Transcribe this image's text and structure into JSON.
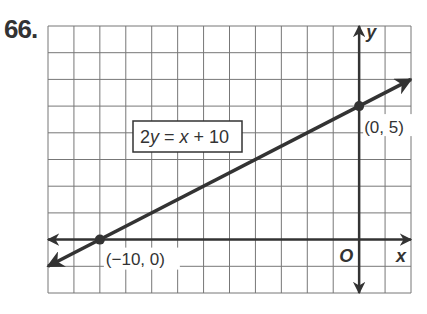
{
  "problem_number": "66.",
  "chart_data": {
    "type": "line",
    "title": "",
    "equation_label": "2y = x + 10",
    "xlabel": "x",
    "ylabel": "y",
    "origin_label": "O",
    "xlim": [
      -12,
      2
    ],
    "ylim": [
      -2,
      8
    ],
    "grid": true,
    "series": [
      {
        "name": "2y = x + 10",
        "x": [
          -12,
          2
        ],
        "y": [
          -1,
          6
        ]
      }
    ],
    "points": [
      {
        "x": -10,
        "y": 0,
        "label": "(−10, 0)"
      },
      {
        "x": 0,
        "y": 5,
        "label": "(0, 5)"
      }
    ]
  }
}
